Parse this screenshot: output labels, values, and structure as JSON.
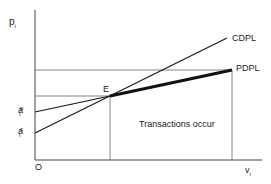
{
  "diagram": {
    "y_axis_label": "p",
    "y_axis_sub": "i",
    "x_axis_label": "v",
    "x_axis_sub": "i",
    "origin_label": "O",
    "equilibrium_label": "E",
    "region_label": "Transactions occur",
    "lines": [
      {
        "name": "CDPL",
        "label": "CDPL"
      },
      {
        "name": "PDPL",
        "label": "PDPL"
      }
    ],
    "intercepts": [
      {
        "base": "a",
        "sup": "p",
        "sub": "i"
      },
      {
        "base": "a",
        "sup": "c",
        "sub": "i"
      }
    ],
    "colors": {
      "line": "#1a1a1a",
      "guide": "#555555",
      "background": "#ffffff"
    }
  }
}
